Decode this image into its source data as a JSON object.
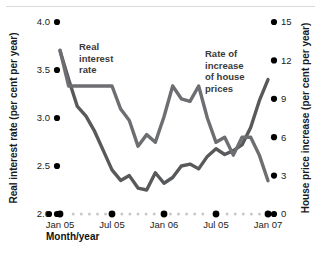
{
  "chart_data": {
    "type": "line",
    "title": "",
    "xlabel": "Month/year",
    "ylabel": "Real interest rate (per cent per year)",
    "ylabel_right": "House price increase (per cent per year)",
    "grid": false,
    "legend_position": "inline-annotations",
    "x_tick_labels": [
      "Jan 05",
      "Jul 05",
      "Jan 06",
      "Jul 05",
      "Jan 07"
    ],
    "x_tick_months": [
      0,
      6,
      12,
      18,
      24
    ],
    "xlim": [
      0,
      24
    ],
    "y_left_ticks": [
      "2.0",
      "2.5",
      "3.0",
      "3.5",
      "4.0"
    ],
    "y_left_values": [
      2.0,
      2.5,
      3.0,
      3.5,
      4.0
    ],
    "ylim_left": [
      2.0,
      4.0
    ],
    "y_right_ticks": [
      "0",
      "3",
      "6",
      "9",
      "12",
      "15"
    ],
    "y_right_values": [
      0,
      3,
      6,
      9,
      12,
      15
    ],
    "ylim_right": [
      0,
      15
    ],
    "series": [
      {
        "name": "Real interest rate",
        "axis": "left",
        "color": "#58595b",
        "annotation": "Real\ninterest\nrate",
        "annotation_lines": [
          "Real",
          "interest",
          "rate"
        ],
        "x": [
          0,
          1,
          2,
          3,
          4,
          5,
          6,
          7,
          8,
          9,
          10,
          11,
          12,
          13,
          14,
          15,
          16,
          17,
          18,
          19,
          20,
          21,
          22,
          23,
          24
        ],
        "values": [
          3.7,
          3.4,
          3.12,
          3.02,
          2.86,
          2.66,
          2.46,
          2.35,
          2.4,
          2.27,
          2.25,
          2.43,
          2.32,
          2.38,
          2.5,
          2.52,
          2.47,
          2.6,
          2.68,
          2.62,
          2.66,
          2.72,
          2.9,
          3.18,
          3.4
        ]
      },
      {
        "name": "Rate of increase of house prices",
        "axis": "right",
        "color": "#6d6e71",
        "annotation": "Rate of\nincrease\nof house\nprices",
        "annotation_lines": [
          "Rate of",
          "increase",
          "of house",
          "prices"
        ],
        "x": [
          0,
          1,
          2,
          3,
          4,
          5,
          6,
          7,
          8,
          9,
          10,
          11,
          12,
          13,
          14,
          15,
          16,
          17,
          18,
          19,
          20,
          21,
          22,
          23,
          24
        ],
        "values": [
          12.8,
          10.0,
          10.0,
          10.0,
          10.0,
          10.0,
          10.0,
          8.2,
          7.3,
          5.3,
          6.2,
          5.6,
          7.6,
          10.0,
          9.0,
          8.8,
          10.0,
          7.5,
          5.6,
          6.0,
          4.6,
          6.0,
          6.0,
          4.6,
          2.6
        ]
      }
    ]
  },
  "annotations": {
    "left_series_label": "Real interest rate",
    "right_series_label": "Rate of increase of house prices"
  }
}
